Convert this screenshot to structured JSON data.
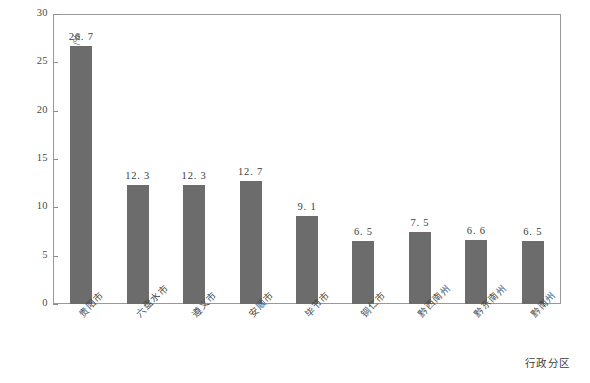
{
  "chart_data": {
    "type": "bar",
    "title": "",
    "xlabel": "行政分区",
    "ylabel": "水资源开发利用率/%",
    "ylim": [
      0,
      30
    ],
    "yticks": [
      0,
      5,
      10,
      15,
      20,
      25,
      30
    ],
    "ytick_labels": [
      "0",
      "5",
      "10",
      "15",
      "20",
      "25",
      "30"
    ],
    "grid": false,
    "legend": null,
    "bar_color": "#6c6c6c",
    "categories": [
      "贵阳市",
      "六盘水市",
      "遵义市",
      "安顺市",
      "毕节市",
      "铜仁市",
      "黔西南州",
      "黔东南州",
      "黔南州"
    ],
    "values": [
      26.7,
      12.3,
      12.3,
      12.7,
      9.1,
      6.5,
      7.5,
      6.6,
      6.5
    ],
    "value_labels": [
      "26. 7",
      "12. 3",
      "12. 3",
      "12. 7",
      "9. 1",
      "6. 5",
      "7. 5",
      "6. 6",
      "6. 5"
    ]
  }
}
